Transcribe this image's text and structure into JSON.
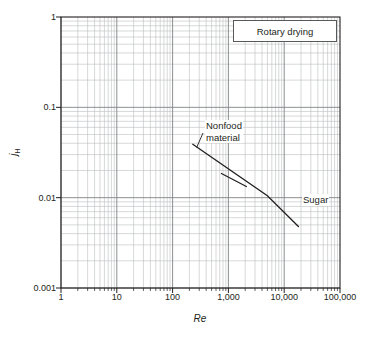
{
  "chart_data": {
    "type": "line",
    "title": "",
    "legend_box_label": "Rotary drying",
    "xlabel": "Re",
    "ylabel_main": "j",
    "ylabel_sub": "H",
    "xscale": "log",
    "yscale": "log",
    "xlim": [
      1,
      100000
    ],
    "ylim": [
      0.001,
      1
    ],
    "grid": "log-minor-and-major",
    "legend_position": "top-right-box",
    "xticks": [
      1,
      10,
      100,
      1000,
      10000,
      100000
    ],
    "xticklabels": [
      "1",
      "10",
      "100",
      "1,000",
      "10,000",
      "100,000"
    ],
    "yticks": [
      0.001,
      0.01,
      0.1,
      1
    ],
    "yticklabels": [
      "0.001",
      "0.01",
      "0.1",
      "1"
    ],
    "series": [
      {
        "name": "Sugar",
        "annotation": "Sugar",
        "x": [
          230,
          5000,
          18000
        ],
        "y": [
          0.039,
          0.0105,
          0.0048
        ]
      },
      {
        "name": "Nonfood material",
        "annotation": "Nonfood material",
        "annotation_lines": [
          "Nonfood",
          "material"
        ],
        "x": [
          750,
          2100
        ],
        "y": [
          0.0185,
          0.0133
        ]
      }
    ],
    "annotations": [
      {
        "text": "Nonfood material",
        "leader": true,
        "points_to_x": 270,
        "points_to_y": 0.036
      },
      {
        "text": "Sugar",
        "leader": false
      }
    ]
  },
  "colors": {
    "background": "#ffffff",
    "axis": "#231f20",
    "grid_major": "#808285",
    "grid_minor": "#bcbec0",
    "curve": "#231f20",
    "legend_border": "#58595b"
  }
}
